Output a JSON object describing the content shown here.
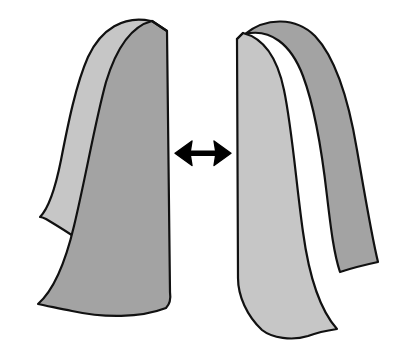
{
  "figure": {
    "background_color": "#ffffff",
    "outline_color": "#111111",
    "outline_width": 2.2,
    "palette": {
      "light_gray": "#c6c6c6",
      "mid_gray": "#a3a3a3",
      "dark_gray": "#8f8f8f",
      "outline": "#111111",
      "arrow": "#000000"
    },
    "objects": [
      {
        "name": "left-sheet",
        "label": "Left curved sheet",
        "back_face_color": "#c6c6c6",
        "front_face_color": "#a3a3a3",
        "orientation": "concave-right",
        "back_face_path": "M 150 22 C 120 17 97 33 85 62 C 73 92 65 140 56 180 C 50 205 45 214 38 219 C 48 225 62 233 74 241 C 92 224 104 198 114 160 C 126 112 134 66 150 40 Z",
        "front_face_path": "M 152 22 C 134 27 120 48 110 82 C 98 122 88 176 76 224 C 66 264 54 290 39 305 C 70 319 110 323 148 316 C 160 312 166 308 170 302 L 168 32 Z",
        "spine_path": "M 152 22 L 168 32 L 170 302"
      },
      {
        "name": "center-arrow",
        "label": "Double-headed separation arrow",
        "color": "#000000",
        "direction": "horizontal-bidirectional",
        "center_x": 203,
        "center_y": 153,
        "span_x": [
          175,
          231
        ],
        "shaft_thickness": 5,
        "head_length": 17,
        "head_half_width": 13
      },
      {
        "name": "right-sheet",
        "label": "Right curved sheet",
        "back_face_color": "#a3a3a3",
        "front_face_color": "#c6c6c6",
        "orientation": "concave-left",
        "back_face_path": "M 246 36 C 268 30 288 42 300 72 C 312 104 318 150 320 196 C 322 232 322 258 316 280 C 330 275 352 268 378 262 C 372 240 366 198 360 152 C 352 98 338 58 318 38 Z",
        "front_face_path": "M 240 36 C 256 44 266 62 272 92 C 280 132 284 186 288 236 C 291 276 297 308 308 330 C 300 334 290 337 281 338 C 270 332 258 322 250 310 C 242 298 238 286 238 276 L 237 40 Z",
        "spine_path": "M 240 36 L 237 40 L 238 276"
      }
    ],
    "arrow_semantics": {
      "meaning": "separation / distance between the two sheets",
      "heads": 2
    }
  }
}
